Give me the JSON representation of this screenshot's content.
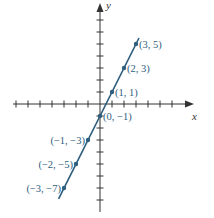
{
  "chart_data": {
    "type": "line",
    "title": "",
    "xlabel": "x",
    "ylabel": "y",
    "equation_implied": "y = 2x - 1",
    "xlim": [
      -8,
      6
    ],
    "ylim": [
      -8,
      8
    ],
    "grid": false,
    "points": [
      {
        "x": -3,
        "y": -7,
        "label": "(−3, −7)"
      },
      {
        "x": -2,
        "y": -5,
        "label": "(−2, −5)"
      },
      {
        "x": -1,
        "y": -3,
        "label": "(−1, −3)"
      },
      {
        "x": 0,
        "y": -1,
        "label": "(0, −1)"
      },
      {
        "x": 1,
        "y": 1,
        "label": "(1, 1)"
      },
      {
        "x": 2,
        "y": 3,
        "label": "(2, 3)"
      },
      {
        "x": 3,
        "y": 5,
        "label": "(3, 5)"
      }
    ],
    "line_color": "#2f5e7e",
    "axis_color": "#333333"
  }
}
